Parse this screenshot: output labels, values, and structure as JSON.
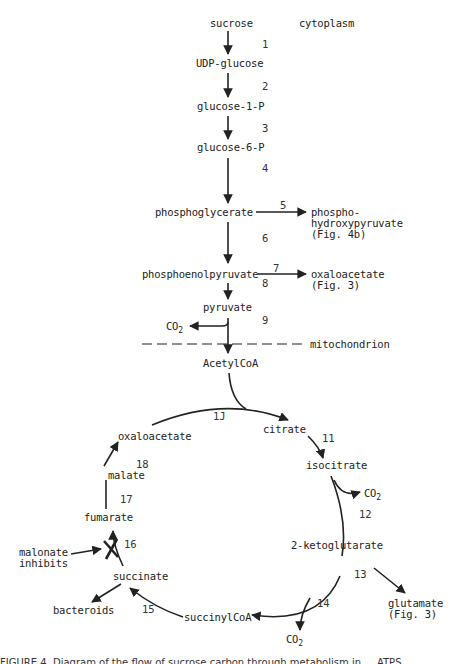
{
  "compartments": {
    "cytoplasm": "cytoplasm",
    "mitochondrion": "mitochondrion"
  },
  "metabolites": {
    "sucrose": "sucrose",
    "udp_glucose": "UDP-glucose",
    "glucose_1_p": "glucose-1-P",
    "glucose_6_p": "glucose-6-P",
    "phosphoglycerate": "phosphoglycerate",
    "phosphohydroxypyruvate": "phospho-\nhydroxypyruvate\n(Fig. 4b)",
    "phosphoenolpyruvate": "phosphoenolpyruvate",
    "oxaloacetate_out": "oxaloacetate\n(Fig. 3)",
    "pyruvate": "pyruvate",
    "co2_pyruvate": "CO",
    "acetylcoa": "AcetylCoA",
    "citrate": "citrate",
    "isocitrate": "isocitrate",
    "co2_isocitrate": "CO",
    "ketoglutarate": "2-ketoglutarate",
    "glutamate": "glutamate\n(Fig. 3)",
    "co2_ketoglutarate": "CO",
    "succinylcoa": "succinylCoA",
    "succinate": "succinate",
    "bacteroids": "bacteroids",
    "fumarate": "fumarate",
    "malate": "malate",
    "oxaloacetate_cycle": "oxaloacetate",
    "malonate": "malonate\ninhibits"
  },
  "subscript": "2",
  "steps": {
    "s1": "1",
    "s2": "2",
    "s3": "3",
    "s4": "4",
    "s5": "5",
    "s6": "6",
    "s7": "7",
    "s8": "8",
    "s9": "9",
    "s10": "1J",
    "s11": "11",
    "s12": "12",
    "s13": "13",
    "s14": "14",
    "s15": "15",
    "s16": "16",
    "s17": "17",
    "s18": "18"
  },
  "caption": "FIGURE 4. Diagram of the flow of sucrose carbon through metabolism in ... ATPS ..."
}
